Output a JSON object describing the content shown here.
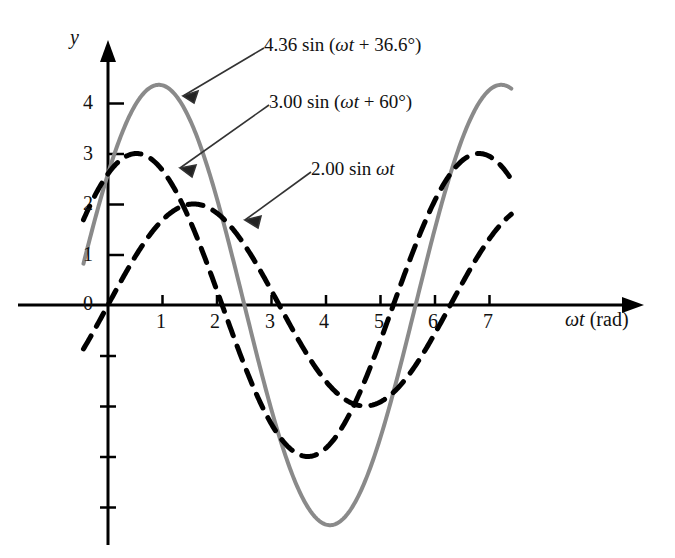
{
  "figure": {
    "kind": "line-plot",
    "background_color": "#ffffff",
    "axis_color": "#000000"
  },
  "chart_data": {
    "type": "line",
    "title": "",
    "subtitle": "",
    "xlabel": "ωt (rad)",
    "ylabel": "y",
    "xlim": [
      -0.6,
      8.2
    ],
    "ylim": [
      -5.0,
      4.9
    ],
    "grid": false,
    "legend": "inline-annotations",
    "x_ticks": [
      1,
      2,
      3,
      4,
      5,
      6,
      7
    ],
    "x_tick_labels": [
      "1",
      "2",
      "3",
      "4",
      "5",
      "6",
      "7"
    ],
    "y_ticks": [
      0,
      1,
      2,
      3,
      4
    ],
    "y_tick_labels": [
      "0",
      "1",
      "2",
      "3",
      "4"
    ],
    "y_minor_ticks_below_axis": [
      -1,
      -2,
      -3,
      -4
    ],
    "x_domain_drawn": [
      -0.45,
      7.4
    ],
    "series": [
      {
        "name": "4.36 sin (ωt + 36.6°)",
        "amplitude": 4.36,
        "phase_deg": 36.6,
        "style": "solid",
        "color": "#8a8a8a",
        "line_width": 4,
        "peak_value": 4.36,
        "trough_value": -4.36,
        "value_at_zero": 2.6
      },
      {
        "name": "3.00 sin (ωt + 60°)",
        "amplitude": 3.0,
        "phase_deg": 60,
        "style": "dashed",
        "color": "#000000",
        "line_width": 5,
        "peak_value": 3.0,
        "trough_value": -3.0,
        "value_at_zero": 2.6
      },
      {
        "name": "2.00 sin ωt",
        "amplitude": 2.0,
        "phase_deg": 0,
        "style": "dashed",
        "color": "#000000",
        "line_width": 5,
        "peak_value": 2.0,
        "trough_value": -2.0,
        "value_at_zero": 0.0
      }
    ]
  },
  "axes": {
    "y_axis_label": "y",
    "x_axis_label_math": "ωt",
    "x_axis_label_unit": "(rad)"
  },
  "tick_labels": {
    "x": [
      "1",
      "2",
      "3",
      "4",
      "5",
      "6",
      "7"
    ],
    "y": [
      "0",
      "1",
      "2",
      "3",
      "4"
    ]
  },
  "annotations": [
    {
      "id": "label-sum",
      "amplitude": "4.36",
      "fn": "sin",
      "open": "(",
      "arg": "ωt",
      "plus": "+",
      "phase": "36.6°",
      "close": ")",
      "full_text": "4.36 sin (ωt + 36.6°)"
    },
    {
      "id": "label-three",
      "amplitude": "3.00",
      "fn": "sin",
      "open": "(",
      "arg": "ωt",
      "plus": "+",
      "phase": "60°",
      "close": ")",
      "full_text": "3.00 sin (ωt + 60°)"
    },
    {
      "id": "label-two",
      "amplitude": "2.00",
      "fn": "sin",
      "open": "",
      "arg": "ωt",
      "plus": "",
      "phase": "",
      "close": "",
      "full_text": "2.00 sin ωt"
    }
  ]
}
